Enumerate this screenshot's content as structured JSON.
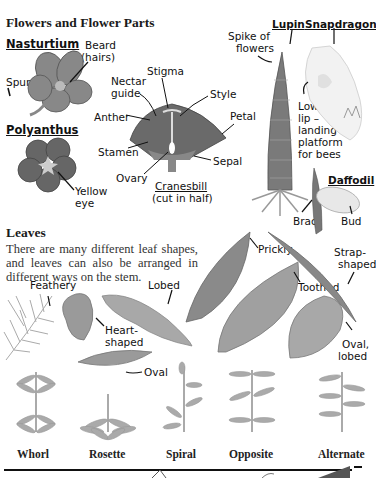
{
  "flowers": {
    "heading": "Flowers and Flower Parts",
    "nasturtium": {
      "title": "Nasturtium",
      "beard": "Beard",
      "hairs": "(hairs)",
      "spur": "Spur"
    },
    "polyanthus": {
      "title": "Polyanthus",
      "yellow": "Yellow",
      "eye": "eye"
    },
    "cranesbill": {
      "nectar1": "Nectar",
      "nectar2": "guide",
      "stigma": "Stigma",
      "style": "Style",
      "anther": "Anther",
      "petal": "Petal",
      "stamen": "Stamen",
      "sepal": "Sepal",
      "ovary": "Ovary",
      "title": "Cranesbill",
      "subtitle": "(cut in half)"
    },
    "lupin": {
      "title": "Lupin",
      "spike1": "Spike of",
      "spike2": "flowers"
    },
    "snapdragon": {
      "title": "Snapdragon",
      "lower1": "Lower",
      "lower2": "lip –",
      "lower3": "landing",
      "lower4": "platform",
      "lower5": "for bees"
    },
    "daffodil": {
      "title": "Daffodil",
      "bract": "Bract",
      "bud": "Bud"
    }
  },
  "leaves": {
    "heading": "Leaves",
    "description": "There are many different leaf shapes, and leaves can also be arranged in different ways on the stem.",
    "shapes": {
      "feathery": "Feathery",
      "lobed": "Lobed",
      "heart1": "Heart-",
      "heart2": "shaped",
      "oval": "Oval",
      "prickly": "Prickly",
      "strap1": "Strap-",
      "strap2": "shaped",
      "toothed": "Toothed",
      "ovallobed1": "Oval,",
      "ovallobed2": "lobed"
    },
    "arrangements": [
      "Whorl",
      "Rosette",
      "Spiral",
      "Opposite",
      "Alternate"
    ]
  },
  "colors": {
    "ink": "#111111",
    "leaf": "#9a9a9a",
    "leaf_dark": "#6e6e6e",
    "flower_dark": "#555555"
  }
}
